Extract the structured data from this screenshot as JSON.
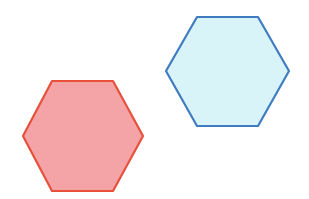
{
  "canvas": {
    "width": 309,
    "height": 199,
    "background": "#ffffff"
  },
  "shapes": [
    {
      "name": "red-hexagon",
      "type": "hexagon",
      "points": "52,81 113,81 143,136 113,191 52,191 23,136",
      "fill": "#f4a4a6",
      "stroke": "#e8503c"
    },
    {
      "name": "blue-hexagon",
      "type": "hexagon",
      "points": "197,17 258,17 289,71 258,126 197,126 166,71",
      "fill": "#d8f4f8",
      "stroke": "#3f7cc0"
    }
  ]
}
